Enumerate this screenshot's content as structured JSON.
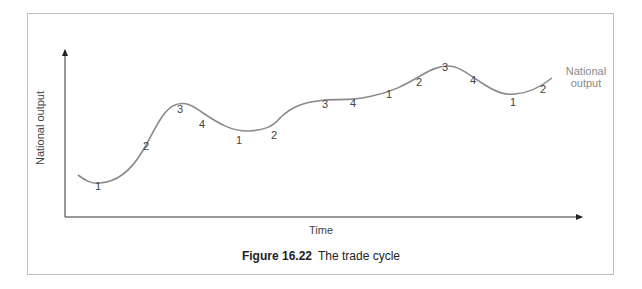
{
  "figure": {
    "number": "Figure 16.22",
    "title": "The trade cycle"
  },
  "axes": {
    "y_label": "National output",
    "x_label": "Time"
  },
  "series_label": {
    "line1": "National",
    "line2": "output"
  },
  "colors": {
    "curve": "#8a8a8a",
    "axis": "#333333",
    "frame": "#bdbdbd",
    "text": "#444444"
  },
  "phase_labels": [
    {
      "text": "1",
      "x": 95,
      "y": 187
    },
    {
      "text": "2",
      "x": 143,
      "y": 147
    },
    {
      "text": "3",
      "x": 177,
      "y": 110
    },
    {
      "text": "4",
      "x": 199,
      "y": 125
    },
    {
      "text": "1",
      "x": 236,
      "y": 141
    },
    {
      "text": "2",
      "x": 271,
      "y": 136
    },
    {
      "text": "3",
      "x": 322,
      "y": 105
    },
    {
      "text": "4",
      "x": 350,
      "y": 104
    },
    {
      "text": "1",
      "x": 386,
      "y": 95
    },
    {
      "text": "2",
      "x": 416,
      "y": 83
    },
    {
      "text": "3",
      "x": 442,
      "y": 68
    },
    {
      "text": "4",
      "x": 470,
      "y": 81
    },
    {
      "text": "1",
      "x": 510,
      "y": 103
    },
    {
      "text": "2",
      "x": 540,
      "y": 90
    }
  ],
  "chart_data": {
    "type": "line",
    "xlabel": "Time",
    "ylabel": "National output",
    "grid": false,
    "legend": "inline label at curve end: National output",
    "series": [
      {
        "name": "National output",
        "points_px": [
          [
            78,
            175
          ],
          [
            96,
            183
          ],
          [
            120,
            172
          ],
          [
            150,
            140
          ],
          [
            170,
            110
          ],
          [
            180,
            105
          ],
          [
            195,
            110
          ],
          [
            220,
            124
          ],
          [
            250,
            111
          ],
          [
            270,
            106
          ],
          [
            290,
            95
          ],
          [
            320,
            82
          ],
          [
            345,
            78
          ],
          [
            375,
            73
          ],
          [
            405,
            63
          ],
          [
            430,
            52
          ],
          [
            445,
            50
          ],
          [
            465,
            58
          ],
          [
            495,
            73
          ],
          [
            515,
            78
          ],
          [
            535,
            74
          ],
          [
            552,
            63
          ]
        ]
      }
    ],
    "phases": [
      "1 (trough)",
      "2 (upswing/recovery)",
      "3 (peak/boom)",
      "4 (downswing/recession)"
    ],
    "phase_sequence": [
      "1",
      "2",
      "3",
      "4",
      "1",
      "2",
      "3",
      "4",
      "1",
      "2",
      "3",
      "4",
      "1",
      "2"
    ]
  }
}
